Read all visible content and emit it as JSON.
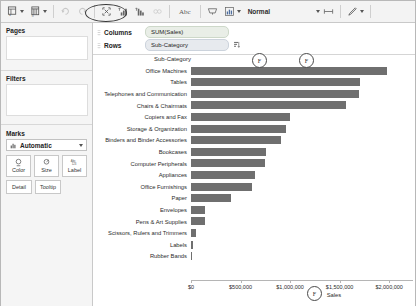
{
  "toolbar": {
    "items": [
      {
        "name": "new-data-source-icon",
        "label": "",
        "glyph": "data"
      },
      {
        "name": "new-worksheet-icon",
        "label": "",
        "glyph": "sheet"
      },
      {
        "name": "undo-icon",
        "label": "",
        "glyph": "undo"
      },
      {
        "name": "redo-icon",
        "label": "",
        "glyph": "redo"
      },
      {
        "name": "clear-sheet-icon",
        "label": "",
        "glyph": "clear"
      },
      {
        "name": "swap-rows-columns-icon",
        "label": "",
        "glyph": "swap"
      },
      {
        "name": "sort-ascending-icon",
        "label": "",
        "glyph": "sort-asc"
      },
      {
        "name": "sort-descending-icon",
        "label": "",
        "glyph": "sort-desc"
      }
    ],
    "abc_label": "Abc",
    "normal_label": "Normal",
    "size_label": "",
    "highlight_label": ""
  },
  "sidebar": {
    "pages_label": "Pages",
    "filters_label": "Filters",
    "marks_label": "Marks",
    "marks_type": "Automatic",
    "cards": [
      {
        "label": "Color",
        "icon": "color-icon"
      },
      {
        "label": "Size",
        "icon": "size-icon"
      },
      {
        "label": "Label",
        "icon": "label-icon"
      }
    ],
    "cards2": [
      {
        "label": "Detail",
        "icon": "detail-icon"
      },
      {
        "label": "Tooltip",
        "icon": "tooltip-icon"
      }
    ]
  },
  "shelves": {
    "columns_label": "Columns",
    "rows_label": "Rows",
    "columns_pill": "SUM(Sales)",
    "rows_pill": "Sub-Category"
  },
  "markers": [
    {
      "name": "annotation-marker-rows-header",
      "glyph": "F"
    },
    {
      "name": "annotation-marker-plot",
      "glyph": "F"
    },
    {
      "name": "annotation-marker-axis",
      "glyph": "F"
    }
  ],
  "chart_data": {
    "type": "bar",
    "title": "",
    "orientation": "horizontal",
    "column_header": "Sub-Category",
    "xlabel": "Sales",
    "ylabel": "Sub-Category",
    "xlim": [
      0,
      2200000
    ],
    "grid": false,
    "tick_values": [
      0,
      500000,
      1000000,
      1500000,
      2000000
    ],
    "tick_labels": [
      "$0",
      "$500,000",
      "$1,000,000",
      "$1,500,000",
      "$2,000,000"
    ],
    "categories": [
      "Office Machines",
      "Tables",
      "Telephones and Communication",
      "Chairs & Chairmats",
      "Copiers and Fax",
      "Storage & Organization",
      "Binders and Binder Accessories",
      "Bookcases",
      "Computer Peripherals",
      "Appliances",
      "Office Furnishings",
      "Paper",
      "Envelopes",
      "Pens & Art Supplies",
      "Scissors, Rulers and Trimmers",
      "Labels",
      "Rubber Bands"
    ],
    "values": [
      1973746,
      1705721,
      1697967,
      1560493,
      1000000,
      955688,
      910085,
      758000,
      744000,
      650000,
      620000,
      400000,
      145000,
      143000,
      55000,
      25000,
      8000
    ],
    "bar_color": "#6f6f6f"
  }
}
